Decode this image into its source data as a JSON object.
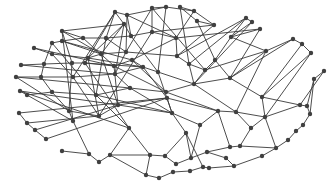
{
  "diagram": {
    "type": "network-graph",
    "directed": false,
    "colors": {
      "background": "#ffffff",
      "edge": "#3a3a3a",
      "node": "#404040"
    },
    "node_radius": 2.2,
    "nodes": [
      {
        "id": 0,
        "x": 115,
        "y": 12
      },
      {
        "id": 1,
        "x": 127,
        "y": 15
      },
      {
        "id": 2,
        "x": 152,
        "y": 8
      },
      {
        "id": 3,
        "x": 166,
        "y": 7
      },
      {
        "id": 4,
        "x": 180,
        "y": 7
      },
      {
        "id": 5,
        "x": 194,
        "y": 11
      },
      {
        "id": 6,
        "x": 124,
        "y": 24
      },
      {
        "id": 7,
        "x": 197,
        "y": 21
      },
      {
        "id": 8,
        "x": 214,
        "y": 25
      },
      {
        "id": 9,
        "x": 246,
        "y": 18
      },
      {
        "id": 10,
        "x": 252,
        "y": 22
      },
      {
        "id": 11,
        "x": 260,
        "y": 29
      },
      {
        "id": 12,
        "x": 62,
        "y": 31
      },
      {
        "id": 13,
        "x": 52,
        "y": 43
      },
      {
        "id": 14,
        "x": 62,
        "y": 41
      },
      {
        "id": 15,
        "x": 83,
        "y": 38
      },
      {
        "id": 16,
        "x": 106,
        "y": 38
      },
      {
        "id": 17,
        "x": 131,
        "y": 36
      },
      {
        "id": 18,
        "x": 152,
        "y": 32
      },
      {
        "id": 19,
        "x": 176,
        "y": 38
      },
      {
        "id": 20,
        "x": 231,
        "y": 37
      },
      {
        "id": 21,
        "x": 293,
        "y": 39
      },
      {
        "id": 22,
        "x": 302,
        "y": 44
      },
      {
        "id": 23,
        "x": 311,
        "y": 53
      },
      {
        "id": 24,
        "x": 34,
        "y": 48
      },
      {
        "id": 25,
        "x": 52,
        "y": 54
      },
      {
        "id": 26,
        "x": 88,
        "y": 58
      },
      {
        "id": 27,
        "x": 101,
        "y": 54
      },
      {
        "id": 28,
        "x": 126,
        "y": 52
      },
      {
        "id": 29,
        "x": 177,
        "y": 56
      },
      {
        "id": 30,
        "x": 189,
        "y": 64
      },
      {
        "id": 31,
        "x": 266,
        "y": 51
      },
      {
        "id": 32,
        "x": 21,
        "y": 65
      },
      {
        "id": 33,
        "x": 44,
        "y": 64
      },
      {
        "id": 34,
        "x": 72,
        "y": 63
      },
      {
        "id": 35,
        "x": 85,
        "y": 63
      },
      {
        "id": 36,
        "x": 114,
        "y": 66
      },
      {
        "id": 37,
        "x": 132,
        "y": 60
      },
      {
        "id": 38,
        "x": 205,
        "y": 70
      },
      {
        "id": 39,
        "x": 215,
        "y": 60
      },
      {
        "id": 40,
        "x": 16,
        "y": 77
      },
      {
        "id": 41,
        "x": 41,
        "y": 77
      },
      {
        "id": 42,
        "x": 73,
        "y": 77
      },
      {
        "id": 43,
        "x": 115,
        "y": 74
      },
      {
        "id": 44,
        "x": 143,
        "y": 67
      },
      {
        "id": 45,
        "x": 158,
        "y": 72
      },
      {
        "id": 46,
        "x": 324,
        "y": 71
      },
      {
        "id": 47,
        "x": 20,
        "y": 91
      },
      {
        "id": 48,
        "x": 27,
        "y": 95
      },
      {
        "id": 49,
        "x": 52,
        "y": 92
      },
      {
        "id": 50,
        "x": 96,
        "y": 95
      },
      {
        "id": 51,
        "x": 130,
        "y": 88
      },
      {
        "id": 52,
        "x": 166,
        "y": 92
      },
      {
        "id": 53,
        "x": 194,
        "y": 84
      },
      {
        "id": 54,
        "x": 230,
        "y": 78
      },
      {
        "id": 55,
        "x": 262,
        "y": 97
      },
      {
        "id": 56,
        "x": 314,
        "y": 79
      },
      {
        "id": 57,
        "x": 19,
        "y": 113
      },
      {
        "id": 58,
        "x": 27,
        "y": 123
      },
      {
        "id": 59,
        "x": 35,
        "y": 130
      },
      {
        "id": 60,
        "x": 46,
        "y": 139
      },
      {
        "id": 61,
        "x": 73,
        "y": 121
      },
      {
        "id": 62,
        "x": 69,
        "y": 111
      },
      {
        "id": 63,
        "x": 99,
        "y": 116
      },
      {
        "id": 64,
        "x": 118,
        "y": 105
      },
      {
        "id": 65,
        "x": 129,
        "y": 128
      },
      {
        "id": 66,
        "x": 167,
        "y": 98
      },
      {
        "id": 67,
        "x": 172,
        "y": 113
      },
      {
        "id": 68,
        "x": 200,
        "y": 125
      },
      {
        "id": 69,
        "x": 218,
        "y": 111
      },
      {
        "id": 70,
        "x": 236,
        "y": 112
      },
      {
        "id": 71,
        "x": 251,
        "y": 128
      },
      {
        "id": 72,
        "x": 265,
        "y": 117
      },
      {
        "id": 73,
        "x": 300,
        "y": 105
      },
      {
        "id": 74,
        "x": 307,
        "y": 106
      },
      {
        "id": 75,
        "x": 310,
        "y": 114
      },
      {
        "id": 76,
        "x": 303,
        "y": 125
      },
      {
        "id": 77,
        "x": 296,
        "y": 131
      },
      {
        "id": 78,
        "x": 288,
        "y": 140
      },
      {
        "id": 79,
        "x": 62,
        "y": 151
      },
      {
        "id": 80,
        "x": 89,
        "y": 154
      },
      {
        "id": 81,
        "x": 99,
        "y": 162
      },
      {
        "id": 82,
        "x": 110,
        "y": 155
      },
      {
        "id": 83,
        "x": 150,
        "y": 155
      },
      {
        "id": 84,
        "x": 165,
        "y": 156
      },
      {
        "id": 85,
        "x": 176,
        "y": 164
      },
      {
        "id": 86,
        "x": 191,
        "y": 158
      },
      {
        "id": 87,
        "x": 207,
        "y": 152
      },
      {
        "id": 88,
        "x": 230,
        "y": 147
      },
      {
        "id": 89,
        "x": 240,
        "y": 146
      },
      {
        "id": 90,
        "x": 276,
        "y": 148
      },
      {
        "id": 91,
        "x": 262,
        "y": 156
      },
      {
        "id": 92,
        "x": 234,
        "y": 166
      },
      {
        "id": 93,
        "x": 209,
        "y": 168
      },
      {
        "id": 94,
        "x": 190,
        "y": 171
      },
      {
        "id": 95,
        "x": 173,
        "y": 172
      },
      {
        "id": 96,
        "x": 159,
        "y": 178
      },
      {
        "id": 97,
        "x": 146,
        "y": 175
      },
      {
        "id": 98,
        "x": 226,
        "y": 158
      },
      {
        "id": 99,
        "x": 186,
        "y": 133
      },
      {
        "id": 100,
        "x": 203,
        "y": 167
      }
    ],
    "edges": [
      [
        0,
        1
      ],
      [
        0,
        6
      ],
      [
        0,
        16
      ],
      [
        0,
        42
      ],
      [
        1,
        17
      ],
      [
        1,
        19
      ],
      [
        1,
        3
      ],
      [
        2,
        3
      ],
      [
        2,
        18
      ],
      [
        2,
        28
      ],
      [
        3,
        5
      ],
      [
        3,
        45
      ],
      [
        4,
        5
      ],
      [
        4,
        7
      ],
      [
        4,
        30
      ],
      [
        5,
        8
      ],
      [
        5,
        19
      ],
      [
        6,
        12
      ],
      [
        6,
        26
      ],
      [
        6,
        17
      ],
      [
        6,
        43
      ],
      [
        7,
        8
      ],
      [
        7,
        39
      ],
      [
        8,
        29
      ],
      [
        8,
        18
      ],
      [
        9,
        10
      ],
      [
        9,
        20
      ],
      [
        9,
        29
      ],
      [
        10,
        20
      ],
      [
        11,
        20
      ],
      [
        11,
        19
      ],
      [
        12,
        15
      ],
      [
        12,
        34
      ],
      [
        12,
        61
      ],
      [
        13,
        14
      ],
      [
        13,
        33
      ],
      [
        14,
        15
      ],
      [
        14,
        27
      ],
      [
        15,
        16
      ],
      [
        15,
        36
      ],
      [
        16,
        17
      ],
      [
        16,
        50
      ],
      [
        17,
        18
      ],
      [
        17,
        45
      ],
      [
        18,
        19
      ],
      [
        18,
        63
      ],
      [
        19,
        29
      ],
      [
        19,
        37
      ],
      [
        20,
        39
      ],
      [
        20,
        31
      ],
      [
        21,
        22
      ],
      [
        22,
        23
      ],
      [
        21,
        54
      ],
      [
        23,
        55
      ],
      [
        24,
        25
      ],
      [
        25,
        26
      ],
      [
        25,
        42
      ],
      [
        26,
        27
      ],
      [
        26,
        44
      ],
      [
        27,
        28
      ],
      [
        27,
        64
      ],
      [
        28,
        29
      ],
      [
        28,
        43
      ],
      [
        29,
        30
      ],
      [
        30,
        38
      ],
      [
        30,
        53
      ],
      [
        31,
        38
      ],
      [
        31,
        54
      ],
      [
        32,
        33
      ],
      [
        33,
        34
      ],
      [
        33,
        41
      ],
      [
        34,
        35
      ],
      [
        34,
        62
      ],
      [
        35,
        36
      ],
      [
        35,
        65
      ],
      [
        36,
        37
      ],
      [
        36,
        64
      ],
      [
        37,
        44
      ],
      [
        37,
        52
      ],
      [
        38,
        39
      ],
      [
        38,
        53
      ],
      [
        39,
        54
      ],
      [
        40,
        41
      ],
      [
        41,
        42
      ],
      [
        41,
        49
      ],
      [
        42,
        43
      ],
      [
        42,
        63
      ],
      [
        43,
        44
      ],
      [
        43,
        51
      ],
      [
        44,
        45
      ],
      [
        44,
        66
      ],
      [
        45,
        53
      ],
      [
        45,
        67
      ],
      [
        46,
        56
      ],
      [
        47,
        48
      ],
      [
        48,
        49
      ],
      [
        48,
        61
      ],
      [
        49,
        50
      ],
      [
        49,
        62
      ],
      [
        50,
        51
      ],
      [
        50,
        65
      ],
      [
        51,
        52
      ],
      [
        51,
        67
      ],
      [
        52,
        53
      ],
      [
        52,
        69
      ],
      [
        53,
        54
      ],
      [
        53,
        70
      ],
      [
        54,
        55
      ],
      [
        55,
        72
      ],
      [
        55,
        73
      ],
      [
        56,
        74
      ],
      [
        56,
        75
      ],
      [
        57,
        58
      ],
      [
        58,
        59
      ],
      [
        58,
        63
      ],
      [
        59,
        60
      ],
      [
        59,
        64
      ],
      [
        60,
        66
      ],
      [
        61,
        62
      ],
      [
        61,
        80
      ],
      [
        62,
        63
      ],
      [
        63,
        64
      ],
      [
        64,
        66
      ],
      [
        64,
        67
      ],
      [
        65,
        83
      ],
      [
        65,
        82
      ],
      [
        66,
        67
      ],
      [
        66,
        69
      ],
      [
        67,
        68
      ],
      [
        67,
        99
      ],
      [
        68,
        69
      ],
      [
        68,
        86
      ],
      [
        69,
        70
      ],
      [
        69,
        88
      ],
      [
        70,
        71
      ],
      [
        70,
        72
      ],
      [
        71,
        72
      ],
      [
        71,
        89
      ],
      [
        72,
        73
      ],
      [
        73,
        74
      ],
      [
        74,
        75
      ],
      [
        75,
        76
      ],
      [
        76,
        77
      ],
      [
        77,
        78
      ],
      [
        78,
        90
      ],
      [
        72,
        90
      ],
      [
        79,
        80
      ],
      [
        80,
        81
      ],
      [
        81,
        82
      ],
      [
        82,
        83
      ],
      [
        82,
        97
      ],
      [
        83,
        84
      ],
      [
        84,
        85
      ],
      [
        84,
        99
      ],
      [
        85,
        86
      ],
      [
        86,
        87
      ],
      [
        87,
        88
      ],
      [
        88,
        89
      ],
      [
        89,
        90
      ],
      [
        90,
        91
      ],
      [
        91,
        92
      ],
      [
        92,
        93
      ],
      [
        93,
        100
      ],
      [
        94,
        100
      ],
      [
        94,
        95
      ],
      [
        95,
        96
      ],
      [
        96,
        97
      ],
      [
        97,
        83
      ],
      [
        98,
        92
      ],
      [
        98,
        87
      ],
      [
        99,
        86
      ],
      [
        99,
        100
      ],
      [
        12,
        27
      ],
      [
        24,
        36
      ],
      [
        32,
        43
      ],
      [
        40,
        51
      ],
      [
        47,
        64
      ],
      [
        57,
        66
      ],
      [
        13,
        50
      ],
      [
        14,
        37
      ],
      [
        1,
        28
      ],
      [
        2,
        38
      ],
      [
        0,
        35
      ],
      [
        9,
        30
      ],
      [
        10,
        53
      ],
      [
        11,
        54
      ],
      [
        21,
        31
      ],
      [
        22,
        55
      ],
      [
        46,
        73
      ],
      [
        23,
        72
      ],
      [
        31,
        70
      ],
      [
        40,
        62
      ],
      [
        47,
        65
      ],
      [
        26,
        63
      ],
      [
        35,
        44
      ],
      [
        36,
        52
      ],
      [
        50,
        67
      ],
      [
        16,
        28
      ],
      [
        6,
        27
      ]
    ]
  }
}
